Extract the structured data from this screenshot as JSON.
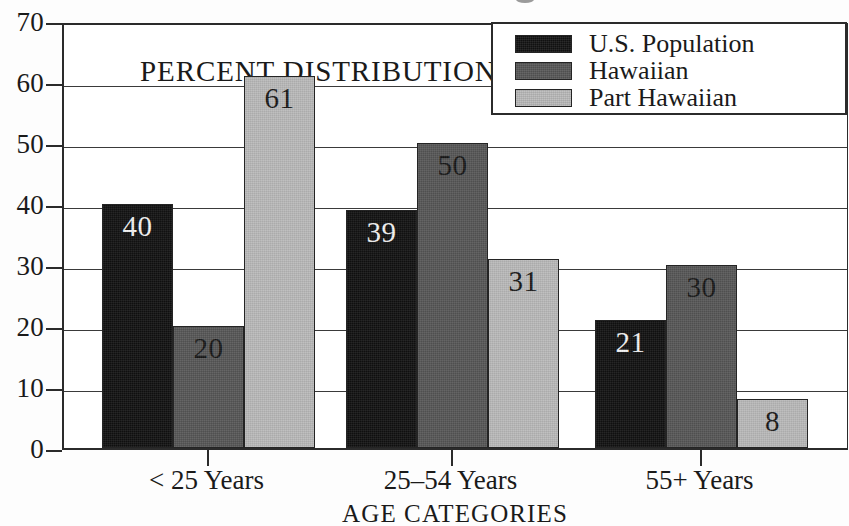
{
  "figure": {
    "in_plot_annotation": "PERCENT DISTRIBUTION (%)",
    "xaxis_title": "AGE CATEGORIES"
  },
  "legend": {
    "position": "top-right",
    "items": [
      {
        "label": "U.S. Population",
        "color": "#111111",
        "swatch_name": "legend-swatch-us-population"
      },
      {
        "label": "Hawaiian",
        "color": "#565656",
        "swatch_name": "legend-swatch-hawaiian"
      },
      {
        "label": "Part Hawaiian",
        "color": "#b9b9b9",
        "swatch_name": "legend-swatch-part-hawaiian"
      }
    ]
  },
  "yaxis": {
    "ticks": [
      "0",
      "10",
      "20",
      "30",
      "40",
      "50",
      "60",
      "70"
    ]
  },
  "chart_data": {
    "type": "bar",
    "title": "",
    "subtitle": "",
    "xlabel": "AGE CATEGORIES",
    "ylabel": "PERCENT DISTRIBUTION (%)",
    "categories": [
      "< 25 Years",
      "25–54 Years",
      "55+ Years"
    ],
    "series": [
      {
        "name": "U.S. Population",
        "color": "#111111",
        "values": [
          40,
          39,
          21
        ]
      },
      {
        "name": "Hawaiian",
        "color": "#565656",
        "values": [
          20,
          50,
          30
        ]
      },
      {
        "name": "Part Hawaiian",
        "color": "#b9b9b9",
        "values": [
          61,
          31,
          8
        ]
      }
    ],
    "ylim": [
      0,
      70
    ],
    "ytick_step": 10,
    "ytick_labels": [
      "0",
      "10",
      "20",
      "30",
      "40",
      "50",
      "60",
      "70"
    ],
    "grid": "horizontal",
    "legend_position": "top-right",
    "bar_value_labels": true,
    "grouping": "clustered",
    "annotations": [
      "PERCENT DISTRIBUTION (%)"
    ]
  }
}
